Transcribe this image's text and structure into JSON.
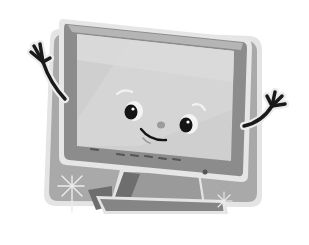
{
  "illustration": {
    "subject": "Cartoon computer monitor character waving with both hands",
    "style": "grayscale clip art",
    "expression": "smiling",
    "elements": [
      "backdrop-panel",
      "monitor-bezel",
      "screen",
      "left-eye",
      "right-eye",
      "nose",
      "smile-mouth",
      "left-waving-arm",
      "right-waving-arm",
      "control-buttons",
      "power-led",
      "stand",
      "sparkle-left",
      "sparkle-right"
    ]
  },
  "colors": {
    "background": "#ffffff",
    "backdrop": "#a9a9a9",
    "backdrop_outline": "#e4e4e4",
    "bezel": "#8c8c8c",
    "bezel_light": "#b5b5b5",
    "screen": "#cfcfcf",
    "screen_highlight": "#dedede",
    "stand": "#9a9a9a",
    "stand_dark": "#6e6e6e",
    "arm": "#1a1a1a",
    "eye_white": "#f4f4f4",
    "pupil": "#151515",
    "sparkle": "#ececec"
  }
}
